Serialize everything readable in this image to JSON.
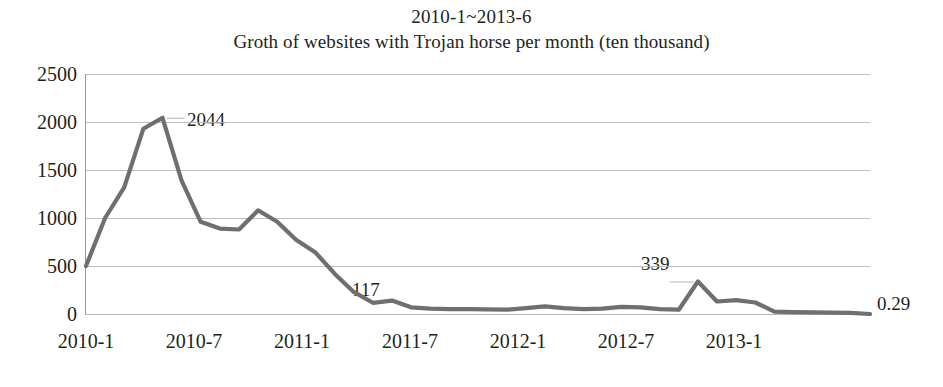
{
  "chart_data": {
    "type": "line",
    "title": "Groth of websites with Trojan horse per month (ten thousand)",
    "subtitle": "2010-1~2013-6",
    "title_line1": "2010-1~2013-6",
    "title_line2": "Groth of websites with Trojan horse per month (ten thousand)",
    "xlabel": "",
    "ylabel": "",
    "ylim": [
      0,
      2500
    ],
    "ytick_labels": [
      "2500",
      "2000",
      "1500",
      "1000",
      "500",
      "0"
    ],
    "ytick_values": [
      2500,
      2000,
      1500,
      1000,
      500,
      0
    ],
    "xtick_labels": [
      "2010-1",
      "2010-7",
      "2011-1",
      "2011-7",
      "2012-1",
      "2012-7",
      "2013-1"
    ],
    "xtick_months": [
      0,
      6,
      12,
      18,
      24,
      30,
      36
    ],
    "grid": true,
    "legend": "none",
    "line_color": "#6f6f6f",
    "grid_color": "#b7b7b7",
    "annotations": [
      {
        "label": "2044",
        "month_index": 4,
        "value": 2044
      },
      {
        "label": "117",
        "month_index": 14,
        "value": 117
      },
      {
        "label": "339",
        "month_index": 32,
        "value": 339
      },
      {
        "label": "0.29",
        "month_index": 41,
        "value": 0.29
      }
    ],
    "x": [
      "2010-1",
      "2010-2",
      "2010-3",
      "2010-4",
      "2010-5",
      "2010-6",
      "2010-7",
      "2010-8",
      "2010-9",
      "2010-10",
      "2010-11",
      "2010-12",
      "2011-1",
      "2011-2",
      "2011-3",
      "2011-4",
      "2011-5",
      "2011-6",
      "2011-7",
      "2011-8",
      "2011-9",
      "2011-10",
      "2011-11",
      "2011-12",
      "2012-1",
      "2012-2",
      "2012-3",
      "2012-4",
      "2012-5",
      "2012-6",
      "2012-7",
      "2012-8",
      "2012-9",
      "2012-10",
      "2012-11",
      "2012-12",
      "2013-1",
      "2013-2",
      "2013-3",
      "2013-4",
      "2013-5",
      "2013-6"
    ],
    "values": [
      500,
      1000,
      1320,
      1930,
      2044,
      1390,
      960,
      890,
      880,
      1080,
      960,
      770,
      640,
      420,
      230,
      117,
      140,
      70,
      55,
      50,
      50,
      48,
      45,
      60,
      80,
      60,
      50,
      55,
      75,
      70,
      50,
      45,
      339,
      130,
      145,
      120,
      25,
      20,
      18,
      15,
      12,
      0.29
    ]
  }
}
